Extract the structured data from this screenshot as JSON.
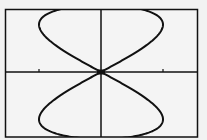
{
  "chart_data": {
    "type": "line",
    "title": "",
    "xlabel": "",
    "ylabel": "",
    "parametric": {
      "x": "sin(2t)",
      "y": "cos(t)",
      "t_range": [
        0,
        6.283
      ]
    },
    "xlim": [
      -1.2,
      1.2
    ],
    "ylim": [
      -0.95,
      0.95
    ],
    "grid": false,
    "axes": true,
    "x_ticks": [
      -1,
      1
    ],
    "legend": null
  },
  "style": {
    "background": "#f2f2f2",
    "ink": "#111111"
  }
}
